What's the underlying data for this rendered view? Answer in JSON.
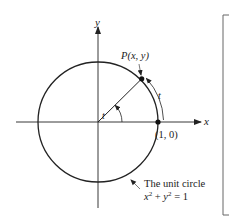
{
  "diagram": {
    "title": "The unit circle",
    "equation": "x² + y² = 1",
    "axis_labels": {
      "x": "x",
      "y": "y"
    },
    "point_P_label": "P(x, y)",
    "point_start_label": "(1, 0)",
    "angle_label": "t",
    "arc_label": "t",
    "caption_line1": "The unit circle",
    "caption_line2_parts": {
      "x": "x",
      "sup1": "2",
      "plus": " + ",
      "y": "y",
      "sup2": "2",
      "eq": " = 1"
    },
    "angle_degrees": 46,
    "colors": {
      "stroke": "#222222",
      "panel_border": "#666666"
    }
  }
}
